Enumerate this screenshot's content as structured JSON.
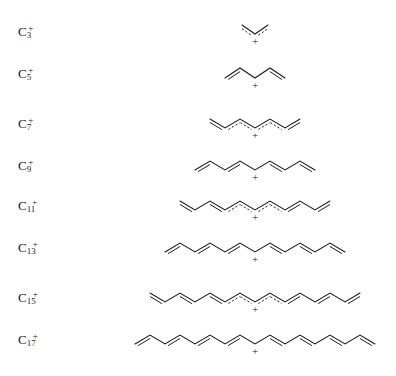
{
  "figure": {
    "background_color": "#ffffff",
    "line_color": "#1c1c1c",
    "width": 396,
    "height": 376,
    "charge_symbol": "+",
    "rows": [
      {
        "label_base": "C",
        "label_sub": "3",
        "label_sup": "+",
        "carbons": 3,
        "delocalized": true,
        "label_y": 24,
        "row_y": 12,
        "center_x": 255,
        "baseline_y": 22,
        "step_x": 13,
        "amplitude": 9,
        "start_phase": "up"
      },
      {
        "label_base": "C",
        "label_sub": "5",
        "label_sup": "+",
        "carbons": 5,
        "delocalized": false,
        "label_y": 66,
        "row_y": 56,
        "center_x": 255,
        "baseline_y": 22,
        "step_x": 15,
        "amplitude": 10,
        "start_phase": "up"
      },
      {
        "label_base": "C",
        "label_sub": "7",
        "label_sup": "+",
        "carbons": 7,
        "delocalized": true,
        "label_y": 116,
        "row_y": 106,
        "center_x": 255,
        "baseline_y": 22,
        "step_x": 15,
        "amplitude": 9,
        "start_phase": "up"
      },
      {
        "label_base": "C",
        "label_sub": "9",
        "label_sup": "+",
        "carbons": 9,
        "delocalized": false,
        "label_y": 158,
        "row_y": 148,
        "center_x": 255,
        "baseline_y": 22,
        "step_x": 15,
        "amplitude": 9,
        "start_phase": "up"
      },
      {
        "label_base": "C",
        "label_sub": "11",
        "label_sup": "+",
        "carbons": 11,
        "delocalized": true,
        "label_y": 198,
        "row_y": 188,
        "center_x": 255,
        "baseline_y": 22,
        "step_x": 15,
        "amplitude": 9,
        "start_phase": "up"
      },
      {
        "label_base": "C",
        "label_sub": "13",
        "label_sup": "+",
        "carbons": 13,
        "delocalized": false,
        "label_y": 240,
        "row_y": 230,
        "center_x": 255,
        "baseline_y": 22,
        "step_x": 15,
        "amplitude": 9,
        "start_phase": "up"
      },
      {
        "label_base": "C",
        "label_sub": "15",
        "label_sup": "+",
        "carbons": 15,
        "delocalized": true,
        "label_y": 290,
        "row_y": 280,
        "center_x": 255,
        "baseline_y": 22,
        "step_x": 15,
        "amplitude": 9,
        "start_phase": "up"
      },
      {
        "label_base": "C",
        "label_sub": "17",
        "label_sup": "+",
        "carbons": 17,
        "delocalized": false,
        "label_y": 332,
        "row_y": 322,
        "center_x": 255,
        "baseline_y": 22,
        "step_x": 15,
        "amplitude": 9,
        "start_phase": "up"
      }
    ]
  }
}
